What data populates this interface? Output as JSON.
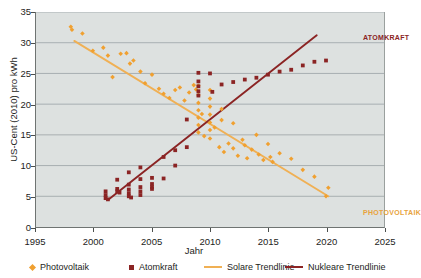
{
  "chart_data": {
    "type": "scatter",
    "title": "",
    "xlabel": "Jahr",
    "ylabel": "US-Cent (2010) pro kWh",
    "xlim": [
      1995,
      2025
    ],
    "ylim": [
      0,
      35
    ],
    "grid": "horizontal",
    "legend_position": "bottom",
    "xticks": [
      1995,
      2000,
      2005,
      2010,
      2015,
      2020,
      2025
    ],
    "yticks": [
      0,
      5,
      10,
      15,
      20,
      25,
      30,
      35
    ],
    "colors": {
      "photovoltaik": "#f0a030",
      "atomkraft": "#8b2424",
      "solare_trendlinie": "#f0b054",
      "nukleare_trendlinie": "#8b2424",
      "plot_background": "#dde1e0",
      "gridline": "#9aa2a6"
    },
    "series": [
      {
        "name": "Photovoltaik",
        "marker": "diamond",
        "color": "#f0a030",
        "points": [
          [
            1998.0,
            32.6
          ],
          [
            1998.1,
            32.1
          ],
          [
            1999.0,
            31.5
          ],
          [
            1999.9,
            28.7
          ],
          [
            2000.8,
            29.2
          ],
          [
            2001.2,
            27.9
          ],
          [
            2001.6,
            24.4
          ],
          [
            2002.3,
            28.2
          ],
          [
            2002.8,
            28.3
          ],
          [
            2003.1,
            26.6
          ],
          [
            2003.4,
            27.1
          ],
          [
            2004.0,
            25.3
          ],
          [
            2004.4,
            23.4
          ],
          [
            2005.0,
            24.8
          ],
          [
            2005.6,
            22.5
          ],
          [
            2006.0,
            21.7
          ],
          [
            2006.5,
            21.0
          ],
          [
            2007.0,
            22.3
          ],
          [
            2007.4,
            22.7
          ],
          [
            2007.8,
            20.6
          ],
          [
            2008.2,
            21.9
          ],
          [
            2008.6,
            23.1
          ],
          [
            2008.8,
            22.4
          ],
          [
            2009.0,
            23.0
          ],
          [
            2009.0,
            21.5
          ],
          [
            2009.0,
            20.2
          ],
          [
            2009.0,
            19.0
          ],
          [
            2009.0,
            17.8
          ],
          [
            2009.0,
            16.6
          ],
          [
            2009.0,
            15.4
          ],
          [
            2009.3,
            18.4
          ],
          [
            2009.5,
            14.8
          ],
          [
            2010.0,
            22.3
          ],
          [
            2010.0,
            20.9
          ],
          [
            2010.0,
            19.6
          ],
          [
            2010.0,
            18.3
          ],
          [
            2010.0,
            17.0
          ],
          [
            2010.0,
            15.8
          ],
          [
            2010.0,
            14.4
          ],
          [
            2010.4,
            16.2
          ],
          [
            2010.8,
            13.0
          ],
          [
            2011.0,
            19.2
          ],
          [
            2011.0,
            17.4
          ],
          [
            2011.2,
            12.2
          ],
          [
            2011.6,
            13.6
          ],
          [
            2012.0,
            16.9
          ],
          [
            2012.0,
            12.8
          ],
          [
            2012.4,
            11.6
          ],
          [
            2012.8,
            14.2
          ],
          [
            2013.0,
            13.3
          ],
          [
            2013.2,
            11.2
          ],
          [
            2013.6,
            12.6
          ],
          [
            2014.0,
            15.0
          ],
          [
            2014.2,
            11.8
          ],
          [
            2014.6,
            10.9
          ],
          [
            2015.0,
            13.5
          ],
          [
            2015.2,
            11.4
          ],
          [
            2015.4,
            10.6
          ],
          [
            2016.0,
            12.0
          ],
          [
            2017.0,
            11.1
          ],
          [
            2018.0,
            9.3
          ],
          [
            2019.0,
            8.2
          ],
          [
            2020.0,
            5.0
          ],
          [
            2020.2,
            6.4
          ]
        ]
      },
      {
        "name": "Atomkraft",
        "marker": "square",
        "color": "#8b2424",
        "points": [
          [
            2001.0,
            5.8
          ],
          [
            2001.0,
            5.2
          ],
          [
            2001.0,
            4.7
          ],
          [
            2001.2,
            4.5
          ],
          [
            2002.0,
            7.7
          ],
          [
            2002.0,
            6.2
          ],
          [
            2002.0,
            5.8
          ],
          [
            2002.2,
            5.6
          ],
          [
            2003.0,
            8.9
          ],
          [
            2003.0,
            6.9
          ],
          [
            2003.0,
            6.1
          ],
          [
            2003.0,
            5.5
          ],
          [
            2003.0,
            5.0
          ],
          [
            2003.2,
            4.8
          ],
          [
            2004.0,
            9.7
          ],
          [
            2004.0,
            7.8
          ],
          [
            2004.0,
            6.5
          ],
          [
            2004.0,
            5.8
          ],
          [
            2004.0,
            5.2
          ],
          [
            2005.0,
            8.0
          ],
          [
            2005.0,
            7.0
          ],
          [
            2005.0,
            6.5
          ],
          [
            2005.0,
            6.2
          ],
          [
            2006.0,
            11.4
          ],
          [
            2006.0,
            7.9
          ],
          [
            2007.0,
            12.5
          ],
          [
            2007.0,
            10.0
          ],
          [
            2008.0,
            17.5
          ],
          [
            2008.0,
            13.0
          ],
          [
            2009.0,
            25.1
          ],
          [
            2009.0,
            23.7
          ],
          [
            2009.0,
            22.9
          ],
          [
            2009.0,
            22.1
          ],
          [
            2009.0,
            21.4
          ],
          [
            2010.0,
            25.0
          ],
          [
            2010.2,
            22.0
          ],
          [
            2011.0,
            23.2
          ],
          [
            2012.0,
            23.6
          ],
          [
            2013.0,
            24.0
          ],
          [
            2014.0,
            24.3
          ],
          [
            2015.0,
            24.8
          ],
          [
            2016.0,
            25.3
          ],
          [
            2017.0,
            25.6
          ],
          [
            2018.0,
            26.3
          ],
          [
            2019.0,
            26.9
          ],
          [
            2020.0,
            27.1
          ]
        ]
      }
    ],
    "trendlines": [
      {
        "name": "Solare Trendlinie",
        "color": "#f0b054",
        "from": [
          1998.3,
          30.3
        ],
        "to": [
          2020.2,
          5.0
        ]
      },
      {
        "name": "Nukleare Trendlinie",
        "color": "#8b2424",
        "from": [
          2001.2,
          4.4
        ],
        "to": [
          2019.2,
          31.2
        ]
      }
    ],
    "annotations": [
      {
        "text": "ATOMKRAFT",
        "color": "#8b2424"
      },
      {
        "text": "PHOTOVOLTAIK",
        "color": "#e8a33d"
      }
    ],
    "legend": [
      {
        "label": "Photovoltaik",
        "marker": "diamond",
        "color": "#f0a030"
      },
      {
        "label": "Atomkraft",
        "marker": "square",
        "color": "#8b2424"
      },
      {
        "label": "Solare Trendlinie",
        "marker": "line",
        "color": "#f0b054"
      },
      {
        "label": "Nukleare Trendlinie",
        "marker": "line",
        "color": "#8b2424"
      }
    ]
  }
}
